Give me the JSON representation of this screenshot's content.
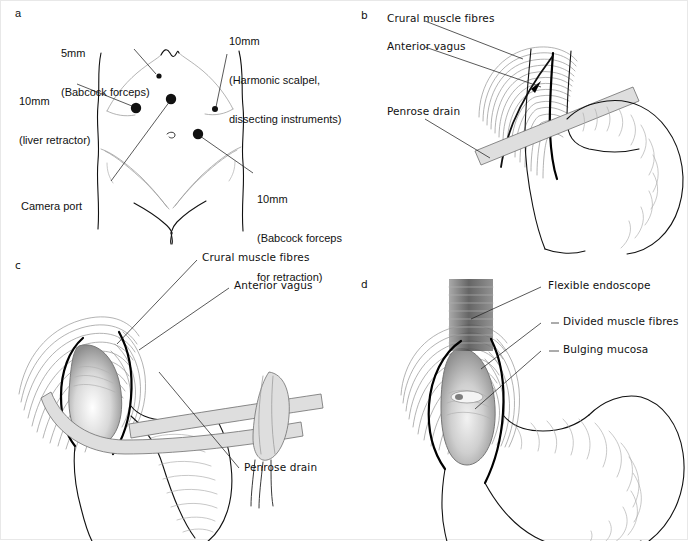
{
  "figure": {
    "background": "#ffffff",
    "ink_color": "#111111",
    "accent_grey": "#9a9a9a",
    "drain_fill": "#dedede"
  },
  "panels": [
    {
      "id": "a",
      "letter": "a",
      "title": "Port placement on the abdomen",
      "labels": [
        {
          "name": "port-5mm-babcock",
          "lines": [
            "5mm",
            "(Babcock forceps)"
          ]
        },
        {
          "name": "port-10mm-harmonic",
          "lines": [
            "10mm",
            "(Harmonic scalpel,",
            "dissecting instruments)"
          ]
        },
        {
          "name": "port-10mm-liver",
          "lines": [
            "10mm",
            "(liver retractor)"
          ]
        },
        {
          "name": "camera-port",
          "lines": [
            "Camera port"
          ]
        },
        {
          "name": "port-10mm-babcock-retraction",
          "lines": [
            "10mm",
            "(Babcock forceps",
            "for retraction)"
          ]
        }
      ]
    },
    {
      "id": "b",
      "letter": "b",
      "title": "Oesophagus encircled with Penrose drain",
      "labels": [
        {
          "name": "crural-muscle-fibres",
          "lines": [
            "Crural muscle fibres"
          ]
        },
        {
          "name": "anterior-vagus",
          "lines": [
            "Anterior vagus"
          ]
        },
        {
          "name": "penrose-drain",
          "lines": [
            "Penrose drain"
          ]
        }
      ]
    },
    {
      "id": "c",
      "letter": "c",
      "title": "Myotomy exposing mucosa with drain retraction",
      "labels": [
        {
          "name": "crural-muscle-fibres",
          "lines": [
            "Crural muscle fibres"
          ]
        },
        {
          "name": "anterior-vagus",
          "lines": [
            "Anterior vagus"
          ]
        },
        {
          "name": "penrose-drain",
          "lines": [
            "Penrose drain"
          ]
        }
      ]
    },
    {
      "id": "d",
      "letter": "d",
      "title": "Endoscopic check of completed myotomy",
      "labels": [
        {
          "name": "flexible-endoscope",
          "lines": [
            "Flexible endoscope"
          ]
        },
        {
          "name": "divided-muscle-fibres",
          "lines": [
            "Divided muscle fibres"
          ]
        },
        {
          "name": "bulging-mucosa",
          "lines": [
            "Bulging mucosa"
          ]
        }
      ]
    }
  ]
}
